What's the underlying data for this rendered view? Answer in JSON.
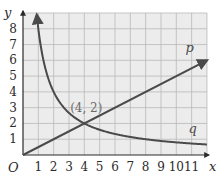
{
  "chart_data": {
    "type": "line",
    "title": "",
    "xlabel": "x",
    "ylabel": "y",
    "origin_label": "O",
    "xlim": [
      0,
      12
    ],
    "ylim": [
      0,
      9
    ],
    "grid": true,
    "x_ticks": [
      "1",
      "2",
      "3",
      "4",
      "5",
      "6",
      "7",
      "8",
      "9",
      "10",
      "11"
    ],
    "y_ticks": [
      "1",
      "2",
      "3",
      "4",
      "5",
      "6",
      "7",
      "8"
    ],
    "series": [
      {
        "name": "p",
        "kind": "linear",
        "equation": "y = x/2",
        "x": [
          0,
          12
        ],
        "y": [
          0,
          6
        ]
      },
      {
        "name": "q",
        "kind": "reciprocal",
        "equation": "y = 8/x",
        "x": [
          0.9,
          1,
          2,
          4,
          8,
          12
        ],
        "y": [
          8.9,
          8,
          4,
          2,
          1,
          0.67
        ]
      }
    ],
    "annotations": [
      {
        "text": "(4, 2)",
        "x": 4,
        "y": 2
      }
    ],
    "colors": {
      "grid_bg": "#ececec",
      "grid_line": "#b9b9b9",
      "curve": "#4a4a4a",
      "axis": "#2a2a2a"
    }
  }
}
